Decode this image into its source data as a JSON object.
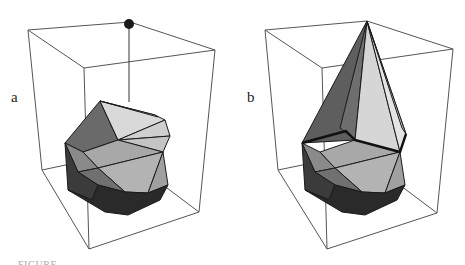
{
  "figure": {
    "panels": [
      {
        "id": "a",
        "label": "a",
        "description": "convex hull polyhedron with an external point above it, joined by a vertical line"
      },
      {
        "id": "b",
        "label": "b",
        "description": "updated convex hull after adding the point; new cone faces meet at apex, horizon edges bold"
      }
    ],
    "caption": "FIGURE …",
    "colors": {
      "background": "#ffffff",
      "box_edge": "#555555",
      "face_light": "#d8d8d8",
      "face_mid": "#a9a9a9",
      "face_dark": "#5e5e5e",
      "face_darkest": "#2a2a2a",
      "point": "#1a1a1a"
    }
  }
}
